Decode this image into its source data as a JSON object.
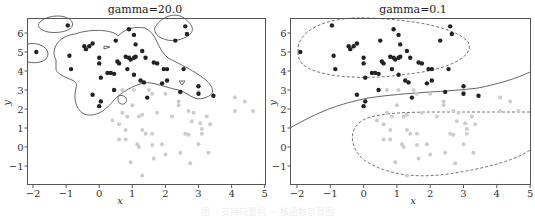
{
  "chart_data": [
    {
      "type": "scatter",
      "title": "gamma=20.0",
      "xlabel": "x",
      "ylabel": "y",
      "xlim": [
        -2,
        5
      ],
      "ylim": [
        -1.9,
        6.8
      ],
      "xticks": [
        "-2",
        "-1",
        "0",
        "1",
        "2",
        "3",
        "4",
        "5"
      ],
      "yticks": [
        "-1",
        "0",
        "1",
        "2",
        "3",
        "4",
        "5",
        "6"
      ],
      "grid": false,
      "legend": null,
      "decision_boundary": "irregular contour lines (overfitting RBF kernel)",
      "series": [
        {
          "name": "class 1",
          "color": "#222222"
        },
        {
          "name": "class 0",
          "color": "#cccccc"
        }
      ]
    },
    {
      "type": "scatter",
      "title": "gamma=0.1",
      "xlabel": "x",
      "ylabel": "y",
      "xlim": [
        -2,
        5
      ],
      "ylim": [
        -1.9,
        6.8
      ],
      "xticks": [
        "-2",
        "-1",
        "0",
        "1",
        "2",
        "3",
        "4",
        "5"
      ],
      "yticks": [
        "-1",
        "0",
        "1",
        "2",
        "3",
        "4",
        "5",
        "6"
      ],
      "grid": false,
      "legend": null,
      "decision_boundary": "smooth curve from (-2,1.0) to (5,3.9); dashed ellipse contours around each class",
      "series": [
        {
          "name": "class 1",
          "color": "#222222"
        },
        {
          "name": "class 0",
          "color": "#cccccc"
        }
      ]
    }
  ],
  "points": {
    "class1": [
      [
        -1.9,
        5.0
      ],
      [
        -0.95,
        6.4
      ],
      [
        -0.9,
        4.8
      ],
      [
        -0.85,
        4.1
      ],
      [
        -0.45,
        5.3
      ],
      [
        -0.4,
        5.15
      ],
      [
        -0.3,
        5.3
      ],
      [
        -0.2,
        5.45
      ],
      [
        0.0,
        4.7
      ],
      [
        0.0,
        4.4
      ],
      [
        0.05,
        3.65
      ],
      [
        0.25,
        3.9
      ],
      [
        0.35,
        3.9
      ],
      [
        0.45,
        3.85
      ],
      [
        0.5,
        5.6
      ],
      [
        0.55,
        4.5
      ],
      [
        0.6,
        4.4
      ],
      [
        0.8,
        4.75
      ],
      [
        0.9,
        4.7
      ],
      [
        0.95,
        4.6
      ],
      [
        1.05,
        4.7
      ],
      [
        1.1,
        4.75
      ],
      [
        0.85,
        4.1
      ],
      [
        0.9,
        6.2
      ],
      [
        1.05,
        5.9
      ],
      [
        1.1,
        5.4
      ],
      [
        1.3,
        5.05
      ],
      [
        1.4,
        4.7
      ],
      [
        1.05,
        3.8
      ],
      [
        1.25,
        3.5
      ],
      [
        1.35,
        3.4
      ],
      [
        1.65,
        4.45
      ],
      [
        1.75,
        4.4
      ],
      [
        1.95,
        4.1
      ],
      [
        2.05,
        4.1
      ],
      [
        2.05,
        3.5
      ],
      [
        2.3,
        5.6
      ],
      [
        2.6,
        6.35
      ],
      [
        2.65,
        5.95
      ],
      [
        2.55,
        4.1
      ],
      [
        2.45,
        2.9
      ],
      [
        3.0,
        3.2
      ],
      [
        3.0,
        2.8
      ],
      [
        3.45,
        2.7
      ],
      [
        0.45,
        3.0
      ],
      [
        -0.2,
        2.75
      ],
      [
        0.05,
        2.4
      ],
      [
        0.0,
        2.15
      ],
      [
        1.45,
        2.6
      ],
      [
        1.9,
        3.35
      ]
    ],
    "class0": [
      [
        0.7,
        3.0
      ],
      [
        1.05,
        3.0
      ],
      [
        1.5,
        3.0
      ],
      [
        1.6,
        2.8
      ],
      [
        2.0,
        2.8
      ],
      [
        2.4,
        2.4
      ],
      [
        3.0,
        2.9
      ],
      [
        4.1,
        2.6
      ],
      [
        4.4,
        2.4
      ],
      [
        1.0,
        2.2
      ],
      [
        2.4,
        2.2
      ],
      [
        0.4,
        1.4
      ],
      [
        0.6,
        1.2
      ],
      [
        0.7,
        1.8
      ],
      [
        0.85,
        1.6
      ],
      [
        1.2,
        1.6
      ],
      [
        1.3,
        1.7
      ],
      [
        1.75,
        1.8
      ],
      [
        2.2,
        1.6
      ],
      [
        2.7,
        1.9
      ],
      [
        2.85,
        1.8
      ],
      [
        3.25,
        1.6
      ],
      [
        4.1,
        1.9
      ],
      [
        4.65,
        1.9
      ],
      [
        0.8,
        0.9
      ],
      [
        1.3,
        0.9
      ],
      [
        1.6,
        0.7
      ],
      [
        1.4,
        0.7
      ],
      [
        2.6,
        0.7
      ],
      [
        2.7,
        0.65
      ],
      [
        2.8,
        1.35
      ],
      [
        3.05,
        1.25
      ],
      [
        3.1,
        0.95
      ],
      [
        3.1,
        0.7
      ],
      [
        3.35,
        1.2
      ],
      [
        0.6,
        0.4
      ],
      [
        0.8,
        0.4
      ],
      [
        1.15,
        0.15
      ],
      [
        1.2,
        0.0
      ],
      [
        1.6,
        0.1
      ],
      [
        1.9,
        0.15
      ],
      [
        3.0,
        0.15
      ],
      [
        2.0,
        -0.4
      ],
      [
        2.45,
        -0.3
      ],
      [
        3.3,
        -0.3
      ],
      [
        0.95,
        -0.8
      ],
      [
        1.65,
        -0.6
      ],
      [
        2.75,
        -0.85
      ],
      [
        1.3,
        -1.5
      ]
    ]
  },
  "caption": "图 ·· 支持向量机 ··· 核函数示意图"
}
